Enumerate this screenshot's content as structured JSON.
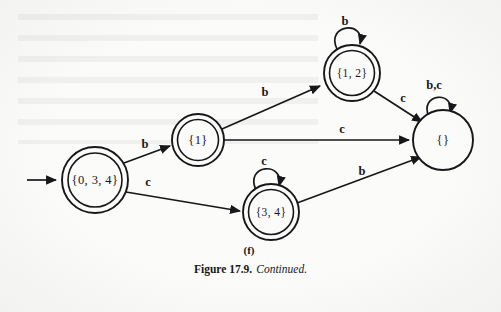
{
  "figure": {
    "caption_number": "Figure 17.9.",
    "caption_text": "Continued.",
    "subfigure_label": "(f)"
  },
  "automaton": {
    "type": "dfa-state-diagram",
    "alphabet": [
      "b",
      "c"
    ],
    "start_state": "{0, 3, 4}",
    "states": [
      {
        "id": "s0",
        "label": "{0, 3, 4}",
        "accepting": true,
        "start": true,
        "cx": 95,
        "cy": 180,
        "r": 33
      },
      {
        "id": "s1",
        "label": "{1}",
        "accepting": true,
        "start": false,
        "cx": 198,
        "cy": 140,
        "r": 26
      },
      {
        "id": "s12",
        "label": "{1, 2}",
        "accepting": true,
        "start": false,
        "cx": 352,
        "cy": 73,
        "r": 28
      },
      {
        "id": "s34",
        "label": "{3, 4}",
        "accepting": true,
        "start": false,
        "cx": 271,
        "cy": 212,
        "r": 28
      },
      {
        "id": "se",
        "label": "{}",
        "accepting": false,
        "start": false,
        "cx": 443,
        "cy": 140,
        "r": 30
      }
    ],
    "transitions": [
      {
        "from": "{0, 3, 4}",
        "to": "{1}",
        "symbol": "b",
        "label_x": 145,
        "label_y": 142
      },
      {
        "from": "{0, 3, 4}",
        "to": "{3, 4}",
        "symbol": "c",
        "label_x": 146,
        "label_y": 184
      },
      {
        "from": "{1}",
        "to": "{1, 2}",
        "symbol": "b",
        "label_x": 262,
        "label_y": 94
      },
      {
        "from": "{1}",
        "to": "{}",
        "symbol": "c",
        "label_x": 340,
        "label_y": 132
      },
      {
        "from": "{1, 2}",
        "to": "{}",
        "symbol": "c",
        "label_x": 400,
        "label_y": 103
      },
      {
        "from": "{3, 4}",
        "to": "{}",
        "symbol": "b",
        "label_x": 362,
        "label_y": 173
      },
      {
        "from": "{1, 2}",
        "to": "{1, 2}",
        "symbol": "b",
        "label_x": 344,
        "label_y": 27,
        "self_loop": true
      },
      {
        "from": "{3, 4}",
        "to": "{3, 4}",
        "symbol": "c",
        "label_x": 265,
        "label_y": 164,
        "self_loop": true
      },
      {
        "from": "{}",
        "to": "{}",
        "symbol": "b,c",
        "label_x": 432,
        "label_y": 88,
        "self_loop": true
      }
    ]
  },
  "colors": {
    "ink": "#17171a",
    "paper": "#fbfbfa"
  }
}
